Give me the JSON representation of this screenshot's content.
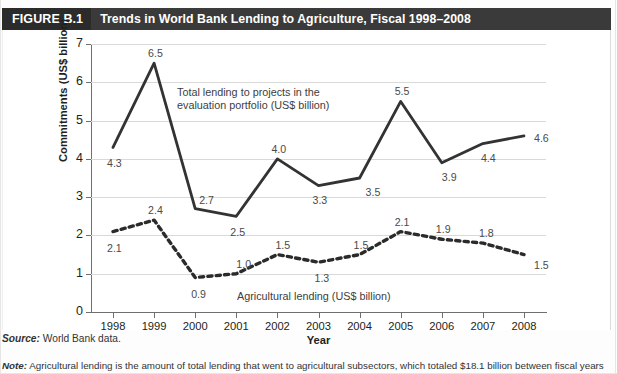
{
  "figure": {
    "tag": "FIGURE B.1",
    "title": "Trends in World Bank Lending to Agriculture, Fiscal 1998–2008"
  },
  "footnotes": {
    "source_label": "Source:",
    "source_text": "World Bank data.",
    "note_label": "Note:",
    "note_text": "Agricultural lending is the amount of total lending that went to agricultural subsectors, which totaled $18.1 billion between fiscal years"
  },
  "chart_data": {
    "type": "line",
    "title": "Trends in World Bank Lending to Agriculture, Fiscal 1998–2008",
    "xlabel": "Year",
    "ylabel": "Commitments (US$ billion)",
    "categories": [
      "1998",
      "1999",
      "2000",
      "2001",
      "2002",
      "2003",
      "2004",
      "2005",
      "2006",
      "2007",
      "2008"
    ],
    "ylim": [
      0,
      7
    ],
    "yticks": [
      "0",
      "1",
      "2",
      "3",
      "4",
      "5",
      "6",
      "7"
    ],
    "grid": "horizontal",
    "legend_position": "inline-annotations",
    "series": [
      {
        "name": "Total lending to projects in the evaluation portfolio (US$ billion)",
        "style": "solid",
        "color": "#333333",
        "values": [
          4.3,
          6.5,
          2.7,
          2.5,
          4.0,
          3.3,
          3.5,
          5.5,
          3.9,
          4.4,
          4.6
        ],
        "labels": [
          "4.3",
          "6.5",
          "2.7",
          "2.5",
          "4.0",
          "3.3",
          "3.5",
          "5.5",
          "3.9",
          "4.4",
          "4.6"
        ]
      },
      {
        "name": "Agricultural lending (US$ billion)",
        "style": "dotted",
        "color": "#2b2b2b",
        "values": [
          2.1,
          2.4,
          0.9,
          1.0,
          1.5,
          1.3,
          1.5,
          2.1,
          1.9,
          1.8,
          1.5
        ],
        "labels": [
          "2.1",
          "2.4",
          "0.9",
          "1.0",
          "1.5",
          "1.3",
          "1.5",
          "2.1",
          "1.9",
          "1.8",
          "1.5"
        ]
      }
    ],
    "annotations": [
      {
        "id": "total-lending-annotation",
        "line1": "Total lending to projects in the",
        "line2": "evaluation portfolio (US$ billion)"
      },
      {
        "id": "agricultural-lending-annotation",
        "line1": "Agricultural lending (US$ billion)"
      }
    ]
  }
}
